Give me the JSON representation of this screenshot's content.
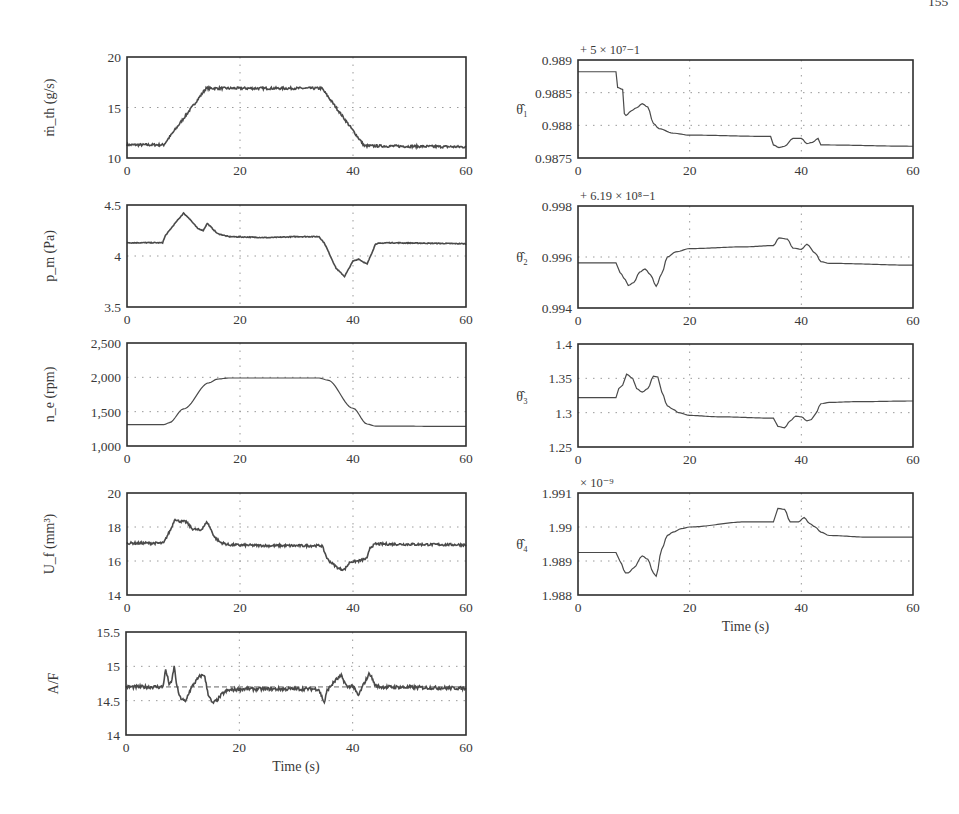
{
  "page": {
    "corner_fragment": "155"
  },
  "chart_data": [
    {
      "id": "mth",
      "type": "line",
      "title": "",
      "ylabel": "ṁ_th (g/s)",
      "xlabel": "",
      "xlim": [
        0,
        60
      ],
      "ylim": [
        10,
        20
      ],
      "xticks": [
        "0",
        "20",
        "40",
        "60"
      ],
      "yticks": [
        "10",
        "15",
        "20"
      ],
      "grid": true,
      "series": [
        {
          "name": "ṁ_th",
          "noise": 0.12,
          "x": [
            0,
            6.5,
            14,
            34.5,
            42,
            60
          ],
          "y": [
            11.3,
            11.3,
            16.9,
            16.9,
            11.2,
            11.1
          ]
        }
      ]
    },
    {
      "id": "pm",
      "type": "line",
      "ylabel": "p_m (Pa)",
      "xlabel": "",
      "xlim": [
        0,
        60
      ],
      "ylim": [
        3.5,
        4.5
      ],
      "xticks": [
        "0",
        "20",
        "40",
        "60"
      ],
      "yticks": [
        "3.5",
        "4",
        "4.5"
      ],
      "grid": true,
      "series": [
        {
          "name": "p_m",
          "noise": 0.004,
          "x": [
            0,
            6.3,
            6.8,
            8.5,
            10,
            11,
            12.5,
            13.5,
            14.2,
            16,
            18,
            25,
            30,
            34,
            35,
            37,
            38.5,
            40,
            41,
            42.5,
            44,
            46,
            60
          ],
          "y": [
            4.13,
            4.13,
            4.2,
            4.32,
            4.42,
            4.37,
            4.27,
            4.25,
            4.32,
            4.22,
            4.19,
            4.18,
            4.19,
            4.19,
            4.12,
            3.88,
            3.8,
            3.95,
            3.97,
            3.92,
            4.12,
            4.13,
            4.12
          ]
        }
      ]
    },
    {
      "id": "ne",
      "type": "line",
      "ylabel": "n_e (rpm)",
      "xlabel": "",
      "xlim": [
        0,
        60
      ],
      "ylim": [
        1000,
        2500
      ],
      "xticks": [
        "0",
        "20",
        "40",
        "60"
      ],
      "yticks": [
        "1,000",
        "1,500",
        "2,000",
        "2,500"
      ],
      "grid": true,
      "series": [
        {
          "name": "n_e",
          "noise": 0,
          "x": [
            0,
            6.5,
            7.5,
            10,
            14.5,
            16,
            18,
            34,
            35.5,
            40,
            42.5,
            44,
            60
          ],
          "y": [
            1310,
            1310,
            1340,
            1540,
            1920,
            1975,
            1990,
            1990,
            1960,
            1550,
            1320,
            1290,
            1285
          ]
        }
      ]
    },
    {
      "id": "uf",
      "type": "line",
      "ylabel": "U_f (mm³)",
      "xlabel": "",
      "xlim": [
        0,
        60
      ],
      "ylim": [
        14,
        20
      ],
      "xticks": [
        "0",
        "20",
        "40",
        "60"
      ],
      "yticks": [
        "14",
        "16",
        "18",
        "20"
      ],
      "grid": true,
      "series": [
        {
          "name": "U_f",
          "noise": 0.07,
          "x": [
            0,
            6.5,
            7,
            7.8,
            8.5,
            9,
            10.5,
            11.5,
            13,
            14.2,
            15.5,
            16.5,
            18,
            25,
            34.5,
            35.5,
            36.5,
            37.5,
            38.5,
            39.5,
            41,
            42.5,
            43,
            44,
            60
          ],
          "y": [
            17.05,
            17.05,
            17.4,
            17.9,
            18.5,
            18.35,
            18.3,
            17.9,
            17.8,
            18.3,
            17.4,
            17.1,
            16.95,
            16.9,
            16.9,
            16.1,
            15.8,
            15.55,
            15.5,
            15.95,
            16.0,
            16.15,
            16.8,
            17.0,
            16.95
          ]
        }
      ]
    },
    {
      "id": "af",
      "type": "line",
      "ylabel": "A/F",
      "xlabel": "Time (s)",
      "xlim": [
        0,
        60
      ],
      "ylim": [
        14,
        15.5
      ],
      "xticks": [
        "0",
        "20",
        "40",
        "60"
      ],
      "yticks": [
        "14",
        "14.5",
        "15",
        "15.5"
      ],
      "grid": true,
      "reference_line": 14.7,
      "series": [
        {
          "name": "A/F",
          "noise": 0.025,
          "x": [
            0,
            6.5,
            7,
            7.6,
            8,
            8.5,
            9,
            9.5,
            10.5,
            11,
            12,
            13,
            13.8,
            14.5,
            15.2,
            16,
            17,
            18,
            20,
            34,
            35,
            35.5,
            37,
            38,
            39,
            40,
            41,
            42,
            43,
            44,
            45,
            60
          ],
          "y": [
            14.7,
            14.7,
            14.95,
            14.75,
            14.75,
            15.0,
            14.7,
            14.55,
            14.48,
            14.6,
            14.75,
            14.85,
            14.88,
            14.6,
            14.46,
            14.5,
            14.6,
            14.65,
            14.67,
            14.67,
            14.47,
            14.65,
            14.8,
            14.86,
            14.7,
            14.72,
            14.57,
            14.75,
            14.9,
            14.72,
            14.7,
            14.68
          ]
        }
      ]
    },
    {
      "id": "theta1",
      "type": "line",
      "ylabel": "θ̂₁",
      "offset_note": "+ 5 × 10⁷−1",
      "xlabel": "",
      "xlim": [
        0,
        60
      ],
      "ylim": [
        0.9875,
        0.989
      ],
      "xticks": [
        "0",
        "20",
        "40",
        "60"
      ],
      "yticks": [
        "0.9875",
        "0.988",
        "0.9885",
        "0.989"
      ],
      "grid": true,
      "series": [
        {
          "name": "θ̂₁",
          "noise": 0,
          "x": [
            0,
            6.8,
            7.1,
            8,
            8.3,
            8.6,
            9.5,
            10.5,
            11.5,
            12.5,
            13.5,
            14.5,
            17,
            20,
            34.5,
            35,
            36,
            37,
            38.5,
            40,
            41,
            42,
            43,
            43.5,
            60
          ],
          "y": [
            0.98882,
            0.98882,
            0.98858,
            0.98855,
            0.98818,
            0.98815,
            0.98822,
            0.98827,
            0.98833,
            0.98828,
            0.98803,
            0.98795,
            0.98788,
            0.98785,
            0.98783,
            0.9877,
            0.98766,
            0.98768,
            0.9878,
            0.9878,
            0.98772,
            0.98774,
            0.9878,
            0.9877,
            0.98768
          ]
        }
      ]
    },
    {
      "id": "theta2",
      "type": "line",
      "ylabel": "θ̂₂",
      "offset_note": "+ 6.19 × 10⁸−1",
      "xlabel": "",
      "xlim": [
        0,
        60
      ],
      "ylim": [
        0.994,
        0.998
      ],
      "xticks": [
        "0",
        "20",
        "40",
        "60"
      ],
      "yticks": [
        "0.994",
        "0.996",
        "0.998"
      ],
      "grid": true,
      "series": [
        {
          "name": "θ̂₂",
          "noise": 0,
          "x": [
            0,
            6.8,
            7.5,
            8.5,
            9,
            10,
            11,
            12,
            13,
            14,
            15,
            16,
            17.5,
            20,
            30,
            35,
            36,
            37.5,
            38.5,
            40,
            41,
            42.5,
            43.5,
            45,
            60
          ],
          "y": [
            0.99577,
            0.99577,
            0.9954,
            0.9951,
            0.99488,
            0.995,
            0.9954,
            0.99553,
            0.9953,
            0.99485,
            0.99535,
            0.996,
            0.9962,
            0.99633,
            0.9964,
            0.99645,
            0.99675,
            0.9967,
            0.99635,
            0.9963,
            0.9965,
            0.99615,
            0.99582,
            0.99575,
            0.99568
          ]
        }
      ]
    },
    {
      "id": "theta3",
      "type": "line",
      "ylabel": "θ̂₃",
      "xlabel": "",
      "xlim": [
        0,
        60
      ],
      "ylim": [
        1.25,
        1.4
      ],
      "xticks": [
        "0",
        "20",
        "40",
        "60"
      ],
      "yticks": [
        "1.25",
        "1.3",
        "1.35",
        "1.4"
      ],
      "grid": true,
      "series": [
        {
          "name": "θ̂₃",
          "noise": 0,
          "x": [
            0,
            6.8,
            7.3,
            8,
            8.7,
            9.8,
            10.5,
            11.5,
            12.5,
            13.5,
            14.3,
            15,
            16,
            17,
            18,
            20,
            25,
            35,
            35.8,
            37,
            38,
            39,
            40,
            41,
            41.8,
            42.5,
            43.5,
            45,
            50,
            60
          ],
          "y": [
            1.322,
            1.322,
            1.335,
            1.34,
            1.356,
            1.35,
            1.335,
            1.33,
            1.335,
            1.353,
            1.352,
            1.33,
            1.31,
            1.305,
            1.3,
            1.296,
            1.294,
            1.292,
            1.28,
            1.278,
            1.288,
            1.295,
            1.294,
            1.288,
            1.29,
            1.298,
            1.313,
            1.315,
            1.316,
            1.317
          ]
        }
      ]
    },
    {
      "id": "theta4",
      "type": "line",
      "ylabel": "θ̂₄",
      "offset_note": "× 10⁻⁹",
      "xlabel": "Time (s)",
      "xlim": [
        0,
        60
      ],
      "ylim": [
        1.988,
        1.991
      ],
      "xticks": [
        "0",
        "20",
        "40",
        "60"
      ],
      "yticks": [
        "1.988",
        "1.989",
        "1.99",
        "1.991"
      ],
      "grid": true,
      "series": [
        {
          "name": "θ̂₄",
          "noise": 0,
          "x": [
            0,
            6.8,
            7.5,
            8.5,
            9,
            10,
            11.5,
            12.5,
            13.5,
            14,
            15,
            16,
            17,
            18.5,
            20,
            30,
            35,
            35.8,
            37,
            38,
            39.5,
            40.5,
            41.5,
            42.5,
            43.5,
            45,
            52,
            60
          ],
          "y": [
            1.98925,
            1.98925,
            1.989,
            1.98865,
            1.98865,
            1.9888,
            1.98915,
            1.98905,
            1.98865,
            1.98855,
            1.98935,
            1.98975,
            1.98985,
            1.98995,
            1.99,
            1.99015,
            1.99015,
            1.99055,
            1.99052,
            1.99015,
            1.99015,
            1.99028,
            1.9901,
            1.99,
            1.98985,
            1.98975,
            1.9897,
            1.9897
          ]
        }
      ]
    }
  ]
}
